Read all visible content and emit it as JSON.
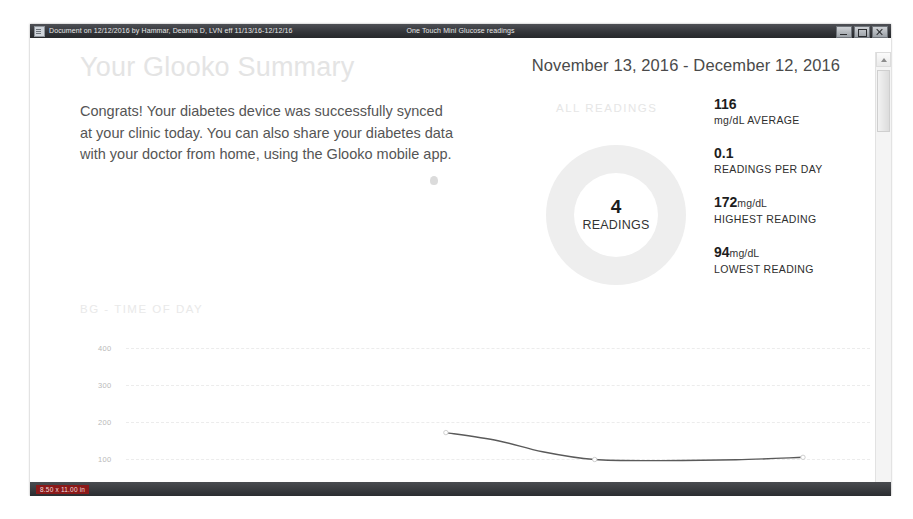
{
  "window": {
    "title_left": "Document on 12/12/2016 by Hammar, Deanna D, LVN eff 11/13/16-12/12/16",
    "title_center": "One Touch Mini Glucose readings",
    "app_icon": "document-icon",
    "buttons": {
      "minimize": "minimize-icon",
      "maximize": "maximize-icon",
      "close": "close-icon"
    }
  },
  "status_bar": {
    "page_size": "8.50 x 11.00 in"
  },
  "scrollbar": {
    "up_arrow": "scroll-up-icon",
    "down_arrow": "scroll-down-icon"
  },
  "report": {
    "title": "Your Glooko Summary",
    "date_range": "November 13, 2016 - December 12, 2016",
    "intro": "Congrats! Your diabetes device was successfully synced at your clinic today. You can also share your diabetes data with your doctor from home, using the Glooko mobile app.",
    "all_readings_label": "ALL READINGS",
    "donut": {
      "count": "4",
      "caption": "READINGS",
      "ring_color": "#eeeeee"
    },
    "stats": [
      {
        "value": "116",
        "unit": "",
        "label": "mg/dL AVERAGE"
      },
      {
        "value": "0.1",
        "unit": "",
        "label": "READINGS PER DAY"
      },
      {
        "value": "172",
        "unit": "mg/dL",
        "label": "HIGHEST READING"
      },
      {
        "value": "94",
        "unit": "mg/dL",
        "label": "LOWEST READING"
      }
    ],
    "bg_section_title": "BG - TIME OF DAY"
  },
  "chart_data": {
    "type": "line",
    "title": "BG - TIME OF DAY",
    "xlabel": "",
    "ylabel": "",
    "ylim": [
      0,
      450
    ],
    "yticks": [
      400,
      300,
      200,
      100
    ],
    "ytick_labels": [
      "400",
      "300",
      "200",
      "100"
    ],
    "grid": true,
    "legend": "none",
    "series": [
      {
        "name": "Blood glucose",
        "color": "#5a5a5a",
        "x": [
          0.43,
          0.5,
          0.56,
          0.63,
          0.72,
          0.82,
          0.91
        ],
        "values": [
          172,
          150,
          120,
          99,
          96,
          98,
          105
        ],
        "points": [
          {
            "x": 0.43,
            "y": 172
          },
          {
            "x": 0.63,
            "y": 99
          },
          {
            "x": 0.91,
            "y": 105
          }
        ]
      }
    ]
  }
}
